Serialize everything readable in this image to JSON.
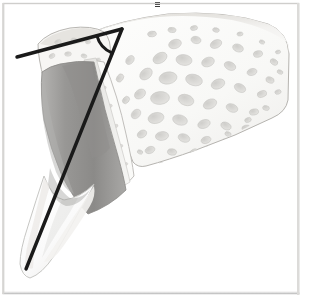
{
  "figure": {
    "modality": "medical-anatomical-illustration",
    "caption": "",
    "frame": {
      "border_color": "#c9c9c9",
      "inner_background": "#ffffff",
      "left": 3,
      "top": 3,
      "width": 296,
      "height": 290
    },
    "palette": {
      "background": "#ffffff",
      "cortical_bone_light": "#f2f1ef",
      "cortical_bone_shadow": "#d8d6d2",
      "trabecular_bone_fill": "#fbfbfa",
      "trabecular_void": "#d5d4d1",
      "trabecular_void_dark": "#b9b8b4",
      "periosteum_outline": "#b0aeaa",
      "dentin_gray": "#9d9c9a",
      "dentin_gray_dark": "#7e7d7b",
      "pulp_shadow": "#8a8987",
      "enamel_white": "#fdfdfd",
      "enamel_edge": "#c6c5c2",
      "pdl_band": "#e7e6e3",
      "measurement_line": "#1a1a1a",
      "angle_arc": "#1a1a1a",
      "tick_mark": "#3a3a3a"
    },
    "annotations": {
      "angle_vertex": {
        "x": 122,
        "y": 29,
        "label": "angle-vertex"
      },
      "reference_line": {
        "label": "horizontal-reference-line",
        "x1": 17,
        "y1": 57,
        "x2": 122,
        "y2": 29,
        "stroke_width": 3.4
      },
      "axis_line": {
        "label": "tooth-long-axis-line",
        "x1": 122,
        "y1": 29,
        "x2": 26,
        "y2": 269,
        "stroke_width": 3.4
      },
      "angle_arc": {
        "label": "angle-arc-marker",
        "radius": 26,
        "stroke_width": 3.0
      },
      "top_tick": {
        "x": 155,
        "y": 2,
        "width": 5,
        "height": 5
      }
    },
    "structures": [
      {
        "name": "cortical-plate-superior",
        "description": "superior cortical bone border sweeping right"
      },
      {
        "name": "trabecular-bone-body",
        "description": "cancellous bone with marrow spaces"
      },
      {
        "name": "nasal-spine-process",
        "description": "upper-left bony projection"
      },
      {
        "name": "alveolar-crest",
        "description": "bone crest adjacent to tooth"
      },
      {
        "name": "incisor-root-dentin",
        "description": "gray tapering tooth root"
      },
      {
        "name": "incisor-crown-enamel",
        "description": "white translucent crown at lower left"
      },
      {
        "name": "periodontal-ligament-space",
        "description": "narrow band between root and bone"
      },
      {
        "name": "lamina-dura",
        "description": "dense bone lining socket"
      }
    ]
  }
}
